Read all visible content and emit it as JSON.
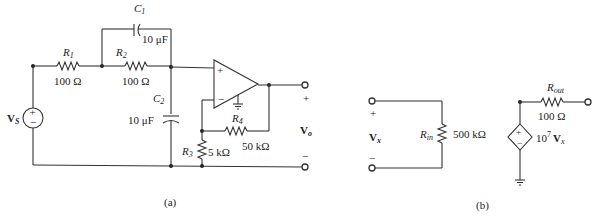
{
  "figure_a": {
    "caption": "(a)",
    "source": {
      "label": "V",
      "sub": "S",
      "plus": "+",
      "minus": "−"
    },
    "R1": {
      "name": "R",
      "sub": "1",
      "value": "100 Ω"
    },
    "R2": {
      "name": "R",
      "sub": "2",
      "value": "100 Ω"
    },
    "C1": {
      "name": "C",
      "sub": "1",
      "value": "10 μF"
    },
    "C2": {
      "name": "C",
      "sub": "2",
      "value": "10 μF"
    },
    "R3": {
      "name": "R",
      "sub": "3",
      "value": "5 kΩ"
    },
    "R4": {
      "name": "R",
      "sub": "4",
      "value": "50 kΩ"
    },
    "opamp": {
      "plus": "+",
      "minus": "−"
    },
    "output": {
      "label": "V",
      "sub": "o",
      "plus": "+",
      "minus": "−"
    }
  },
  "figure_b": {
    "caption": "(b)",
    "input": {
      "label": "V",
      "sub": "x",
      "plus": "+",
      "minus": "−"
    },
    "Rin": {
      "name": "R",
      "sub": "in",
      "value": "500 kΩ"
    },
    "Rout": {
      "name": "R",
      "sub": "out",
      "value": "100 Ω"
    },
    "dep_source": {
      "gain_base": "10",
      "gain_exp": "7",
      "var": "V",
      "var_sub": "x",
      "plus": "+",
      "minus": "−"
    }
  }
}
